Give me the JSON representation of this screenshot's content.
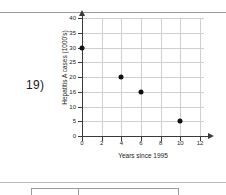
{
  "question_number": "19)",
  "chart_data": {
    "type": "scatter",
    "title": "",
    "xlabel": "Years since 1995",
    "ylabel": "Hepatitis A cases (1000's)",
    "xlim": [
      0,
      12
    ],
    "ylim": [
      0,
      40
    ],
    "xticks": [
      0,
      2,
      4,
      6,
      8,
      10,
      12
    ],
    "yticks": [
      0,
      5,
      10,
      15,
      20,
      25,
      30,
      35,
      40
    ],
    "xtick_labels": [
      "0",
      "2",
      "4",
      "6",
      "8",
      "10",
      "12"
    ],
    "ytick_labels": [
      "0",
      "5",
      "10",
      "16",
      "20",
      "25",
      "30",
      "35",
      "40"
    ],
    "grid": true,
    "legend": "none",
    "points": [
      {
        "x": 0,
        "y": 30
      },
      {
        "x": 4,
        "y": 20
      },
      {
        "x": 6,
        "y": 15
      },
      {
        "x": 10,
        "y": 5
      }
    ],
    "series": [
      {
        "name": "Hepatitis A cases",
        "x": [
          0,
          4,
          6,
          10
        ],
        "values": [
          30,
          20,
          15,
          5
        ]
      }
    ],
    "marker_color": "#111111",
    "grid_color": "#cfcfcf",
    "axis_color": "#3a3a3a"
  },
  "table_preview": {
    "cell_1": "",
    "cell_2": ""
  }
}
